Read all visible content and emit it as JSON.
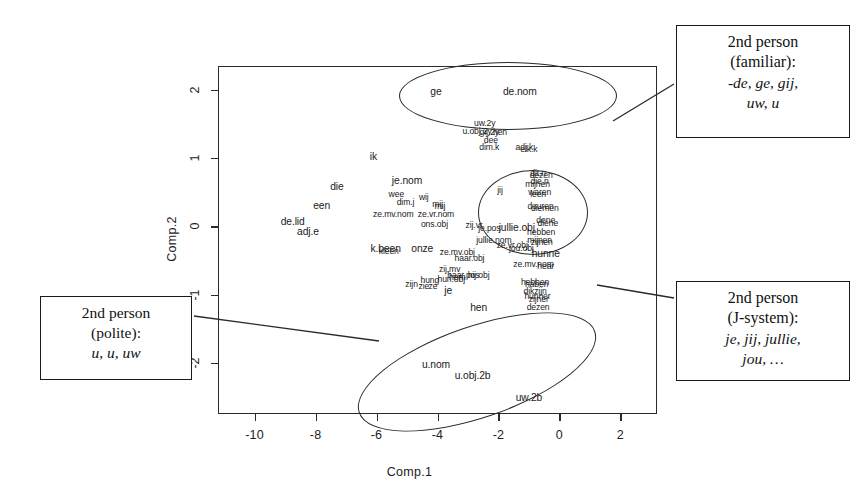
{
  "chart_data": {
    "type": "scatter",
    "title": "",
    "xlabel": "Comp.1",
    "ylabel": "Comp.2",
    "xlim": [
      -11.2,
      3.2
    ],
    "ylim": [
      -2.75,
      2.35
    ],
    "xticks": [
      "-10",
      "-8",
      "-6",
      "-4",
      "-2",
      "0",
      "2"
    ],
    "xtick_values": [
      -10,
      -8,
      -6,
      -4,
      -2,
      0,
      2
    ],
    "yticks": [
      "2",
      "1",
      "0",
      "-1",
      "-2"
    ],
    "ytick_values": [
      2,
      1,
      0,
      -1,
      -2
    ],
    "grid": false,
    "legend": "none",
    "point_marker": "text-label",
    "points": [
      {
        "label": "ge",
        "x": -4.05,
        "y": 1.97,
        "size": "md"
      },
      {
        "label": "de.nom",
        "x": -1.3,
        "y": 1.97,
        "size": "md"
      },
      {
        "label": "uw.2y",
        "x": -2.45,
        "y": 1.52,
        "size": "sm"
      },
      {
        "label": "u.obj.2y",
        "x": -2.7,
        "y": 1.4,
        "size": "sm"
      },
      {
        "label": "gij.2y",
        "x": -2.3,
        "y": 1.38,
        "size": "sm"
      },
      {
        "label": "hen",
        "x": -1.95,
        "y": 1.38,
        "size": "sm"
      },
      {
        "label": "dee",
        "x": -2.25,
        "y": 1.26,
        "size": "sm"
      },
      {
        "label": "dim.k",
        "x": -2.3,
        "y": 1.17,
        "size": "sm"
      },
      {
        "label": "adj.k",
        "x": -1.15,
        "y": 1.17,
        "size": "sm"
      },
      {
        "label": "elk.k",
        "x": -1.0,
        "y": 1.13,
        "size": "sm"
      },
      {
        "label": "ik",
        "x": -6.1,
        "y": 1.02,
        "size": "md"
      },
      {
        "label": "je.nom",
        "x": -5.0,
        "y": 0.66,
        "size": "md"
      },
      {
        "label": "die",
        "x": -7.3,
        "y": 0.58,
        "size": "md"
      },
      {
        "label": "wee",
        "x": -5.35,
        "y": 0.47,
        "size": "sm"
      },
      {
        "label": "wij",
        "x": -4.45,
        "y": 0.43,
        "size": "sm"
      },
      {
        "label": "dim.j",
        "x": -5.05,
        "y": 0.36,
        "size": "sm"
      },
      {
        "label": "mij",
        "x": -4.0,
        "y": 0.33,
        "size": "sm"
      },
      {
        "label": "mij",
        "x": -3.92,
        "y": 0.3,
        "size": "sm"
      },
      {
        "label": "een",
        "x": -7.8,
        "y": 0.3,
        "size": "md"
      },
      {
        "label": "ze.mv.nom",
        "x": -5.45,
        "y": 0.18,
        "size": "sm"
      },
      {
        "label": "ze.vr.nom",
        "x": -4.05,
        "y": 0.18,
        "size": "sm"
      },
      {
        "label": "de.lid",
        "x": -8.75,
        "y": 0.06,
        "size": "md"
      },
      {
        "label": "adj.e",
        "x": -8.25,
        "y": -0.08,
        "size": "md"
      },
      {
        "label": "ons.obj",
        "x": -4.1,
        "y": 0.04,
        "size": "sm"
      },
      {
        "label": "zij.vr",
        "x": -2.8,
        "y": 0.02,
        "size": "sm"
      },
      {
        "label": "jij",
        "x": -1.95,
        "y": 0.53,
        "size": "sm"
      },
      {
        "label": "je.pos",
        "x": -2.3,
        "y": -0.03,
        "size": "sm"
      },
      {
        "label": "jullie.obj",
        "x": -1.4,
        "y": -0.02,
        "size": "md"
      },
      {
        "label": "jullie.nom",
        "x": -2.15,
        "y": -0.2,
        "size": "sm"
      },
      {
        "label": "ze.vr.obj",
        "x": -1.55,
        "y": -0.27,
        "size": "sm"
      },
      {
        "label": "jou.obj",
        "x": -1.25,
        "y": -0.32,
        "size": "sm"
      },
      {
        "label": "k.been",
        "x": -5.7,
        "y": -0.33,
        "size": "md"
      },
      {
        "label": "kleen",
        "x": -5.6,
        "y": -0.36,
        "size": "sm"
      },
      {
        "label": "onze",
        "x": -4.5,
        "y": -0.33,
        "size": "md"
      },
      {
        "label": "ze.mv.obj",
        "x": -3.35,
        "y": -0.38,
        "size": "sm"
      },
      {
        "label": "haar.obj",
        "x": -2.95,
        "y": -0.47,
        "size": "sm"
      },
      {
        "label": "zij.mv",
        "x": -3.6,
        "y": -0.62,
        "size": "sm"
      },
      {
        "label": "haar.pos",
        "x": -3.15,
        "y": -0.72,
        "size": "sm"
      },
      {
        "label": "hun.obj",
        "x": -3.55,
        "y": -0.77,
        "size": "sm"
      },
      {
        "label": "hem",
        "x": -3.35,
        "y": -0.74,
        "size": "sm"
      },
      {
        "label": "hij.obj",
        "x": -2.65,
        "y": -0.72,
        "size": "sm"
      },
      {
        "label": "hung",
        "x": -4.25,
        "y": -0.78,
        "size": "sm"
      },
      {
        "label": "zijn",
        "x": -4.85,
        "y": -0.85,
        "size": "sm"
      },
      {
        "label": "zie",
        "x": -4.45,
        "y": -0.88,
        "size": "sm"
      },
      {
        "label": "ze",
        "x": -4.15,
        "y": -0.88,
        "size": "sm"
      },
      {
        "label": "je",
        "x": -3.65,
        "y": -0.95,
        "size": "md"
      },
      {
        "label": "hen",
        "x": -2.65,
        "y": -1.2,
        "size": "md"
      },
      {
        "label": "dit.n",
        "x": -0.7,
        "y": 0.78,
        "size": "sm"
      },
      {
        "label": "dezen",
        "x": -0.6,
        "y": 0.75,
        "size": "sm"
      },
      {
        "label": "die.n",
        "x": -0.65,
        "y": 0.66,
        "size": "sm"
      },
      {
        "label": "mijnen",
        "x": -0.72,
        "y": 0.62,
        "size": "sm"
      },
      {
        "label": "waren",
        "x": -0.65,
        "y": 0.5,
        "size": "sm"
      },
      {
        "label": "leen",
        "x": -0.7,
        "y": 0.47,
        "size": "sm"
      },
      {
        "label": "duuren",
        "x": -0.62,
        "y": 0.3,
        "size": "sm"
      },
      {
        "label": "diemen",
        "x": -0.48,
        "y": 0.27,
        "size": "sm"
      },
      {
        "label": "dene",
        "x": -0.45,
        "y": 0.1,
        "size": "sm"
      },
      {
        "label": "diene",
        "x": -0.38,
        "y": 0.05,
        "size": "sm"
      },
      {
        "label": "hebben",
        "x": -0.6,
        "y": -0.08,
        "size": "sm"
      },
      {
        "label": "mijnen",
        "x": -0.65,
        "y": -0.2,
        "size": "sm"
      },
      {
        "label": "zijnen",
        "x": -0.58,
        "y": -0.23,
        "size": "sm"
      },
      {
        "label": "hunne",
        "x": -0.45,
        "y": -0.4,
        "size": "md"
      },
      {
        "label": "ze.mv.nom",
        "x": -0.85,
        "y": -0.55,
        "size": "sm"
      },
      {
        "label": "hear",
        "x": -0.45,
        "y": -0.58,
        "size": "sm"
      },
      {
        "label": "hebben",
        "x": -0.8,
        "y": -0.82,
        "size": "sm"
      },
      {
        "label": "haben",
        "x": -0.75,
        "y": -0.85,
        "size": "sm"
      },
      {
        "label": "dikzijn",
        "x": -0.8,
        "y": -0.95,
        "size": "sm"
      },
      {
        "label": "hunner",
        "x": -0.72,
        "y": -1.02,
        "size": "sm"
      },
      {
        "label": "zijner",
        "x": -0.68,
        "y": -1.06,
        "size": "sm"
      },
      {
        "label": "dezen",
        "x": -0.7,
        "y": -1.18,
        "size": "sm"
      },
      {
        "label": "u.nom",
        "x": -4.05,
        "y": -2.03,
        "size": "md"
      },
      {
        "label": "u.obj.2b",
        "x": -2.85,
        "y": -2.2,
        "size": "md"
      },
      {
        "label": "uw.2b",
        "x": -1.0,
        "y": -2.52,
        "size": "md"
      }
    ],
    "clusters": [
      {
        "name": "2nd person (familiar)",
        "forms": "-de, ge, gij, uw, u",
        "members": [
          "ge",
          "de.nom",
          "uw.2y",
          "u.obj.2y",
          "gij.2y"
        ]
      },
      {
        "name": "2nd person (J-system)",
        "forms": "je, jij, jullie, jou, …",
        "members": [
          "jij",
          "jullie.obj",
          "je.pos",
          "jullie.nom",
          "jou.obj"
        ]
      },
      {
        "name": "2nd person (polite)",
        "forms": "u, u, uw",
        "members": [
          "u.nom",
          "u.obj.2b",
          "uw.2b"
        ]
      }
    ]
  },
  "annotations": {
    "familiar": {
      "line1": "2nd person",
      "line2": "(familiar):",
      "forms1": "-de, ge, gij,",
      "forms2": "uw, u"
    },
    "jsystem": {
      "line1": "2nd person",
      "line2": "(J-system):",
      "forms1": "je, jij, jullie,",
      "forms2": "jou, …"
    },
    "polite": {
      "line1": "2nd person",
      "line2": "(polite):",
      "forms1": "u, u, uw"
    }
  }
}
